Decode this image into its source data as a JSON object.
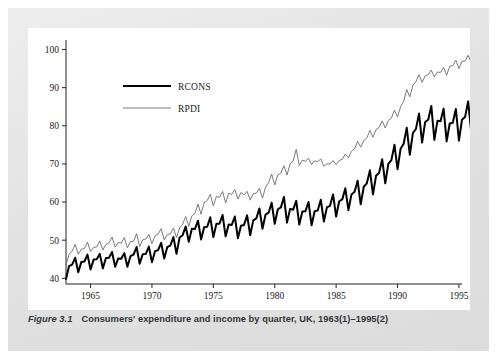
{
  "figure": {
    "caption_number": "Figure 3.1",
    "caption_text": "Consumers' expenditure and income by quarter, UK, 1963(1)–1995(2)",
    "panel_bg": "#ffffff",
    "frame_bg": "#e4e4e4"
  },
  "chart_data": {
    "type": "line",
    "title": "Consumers' expenditure and income by quarter, UK, 1963(1)–1995(2)",
    "xlabel": "",
    "ylabel": "",
    "xlim": [
      1963.0,
      1995.25
    ],
    "ylim": [
      38.5,
      102.5
    ],
    "grid": false,
    "legend_position": "upper-left-inside",
    "xticks": [
      1965,
      1970,
      1975,
      1980,
      1985,
      1990,
      1995
    ],
    "xtick_labels": [
      "1965",
      "1970",
      "1975",
      "1980",
      "1985",
      "1990",
      "1995"
    ],
    "yticks": [
      40,
      50,
      60,
      70,
      80,
      90,
      100
    ],
    "ytick_labels": [
      "40",
      "50",
      "60",
      "70",
      "80",
      "90",
      "100"
    ],
    "x_start": 1963.0,
    "x_step": 0.25,
    "series": [
      {
        "name": "RCONS",
        "color": "#000000",
        "width": 2.0,
        "values": [
          39.8,
          43.2,
          43.6,
          45.4,
          41.6,
          44.3,
          44.4,
          46.2,
          42.3,
          44.9,
          45.0,
          46.4,
          42.6,
          45.3,
          45.4,
          46.9,
          43.0,
          45.2,
          45.1,
          46.6,
          43.0,
          45.8,
          46.2,
          48.2,
          43.8,
          46.3,
          46.4,
          48.3,
          44.2,
          47.1,
          47.4,
          49.3,
          45.2,
          48.2,
          48.6,
          50.8,
          46.4,
          50.7,
          51.3,
          53.6,
          49.6,
          53.0,
          52.9,
          55.1,
          50.2,
          53.4,
          53.5,
          56.0,
          50.8,
          54.3,
          54.3,
          56.6,
          51.0,
          54.1,
          54.0,
          56.2,
          50.5,
          53.8,
          54.0,
          56.5,
          51.3,
          55.2,
          55.7,
          58.3,
          53.0,
          56.7,
          57.2,
          59.8,
          54.3,
          58.1,
          58.6,
          61.3,
          54.6,
          58.2,
          58.0,
          60.3,
          54.1,
          57.5,
          57.6,
          60.0,
          53.9,
          57.6,
          57.8,
          60.6,
          54.9,
          58.6,
          59.0,
          62.0,
          56.2,
          60.2,
          60.7,
          63.6,
          57.9,
          62.0,
          62.7,
          65.6,
          59.4,
          64.0,
          64.9,
          68.3,
          62.0,
          66.9,
          67.7,
          71.2,
          64.9,
          70.0,
          71.0,
          75.0,
          68.6,
          74.0,
          75.3,
          79.5,
          72.4,
          78.1,
          79.2,
          83.2,
          75.6,
          81.0,
          81.6,
          85.2,
          76.3,
          81.3,
          81.2,
          84.5,
          75.9,
          80.6,
          80.8,
          84.4,
          76.1,
          81.6,
          82.3,
          86.4,
          78.4,
          84.2,
          85.3,
          89.8,
          81.5,
          87.4,
          88.1,
          91.9,
          83.2,
          88.0
        ]
      },
      {
        "name": "RPDI",
        "color": "#6b6b6b",
        "width": 0.9,
        "values": [
          43.5,
          46.3,
          47.1,
          48.9,
          46.3,
          47.6,
          47.8,
          49.5,
          47.0,
          48.1,
          48.2,
          49.8,
          47.4,
          48.9,
          49.3,
          50.8,
          48.2,
          49.4,
          49.2,
          50.7,
          48.0,
          49.6,
          49.7,
          51.7,
          48.3,
          50.1,
          50.3,
          51.5,
          49.1,
          51.1,
          51.6,
          53.0,
          50.1,
          51.5,
          51.6,
          53.2,
          50.7,
          53.2,
          54.2,
          56.2,
          53.6,
          56.4,
          57.0,
          59.5,
          56.8,
          59.8,
          60.4,
          62.0,
          59.0,
          61.5,
          61.2,
          62.8,
          59.8,
          62.3,
          62.0,
          63.3,
          60.8,
          62.5,
          61.9,
          62.8,
          60.5,
          62.2,
          62.3,
          63.6,
          61.0,
          63.9,
          65.1,
          67.3,
          64.5,
          67.1,
          67.6,
          69.5,
          67.1,
          70.0,
          70.8,
          73.8,
          69.6,
          71.0,
          70.7,
          71.5,
          69.8,
          70.8,
          70.6,
          71.3,
          69.4,
          70.0,
          70.0,
          70.9,
          69.8,
          70.9,
          71.2,
          72.6,
          71.6,
          73.3,
          74.0,
          75.9,
          74.4,
          76.1,
          76.8,
          78.8,
          77.0,
          79.0,
          79.6,
          81.3,
          79.4,
          81.4,
          82.0,
          84.1,
          82.3,
          85.0,
          86.4,
          89.5,
          87.6,
          90.6,
          91.6,
          93.4,
          91.4,
          93.1,
          93.4,
          94.6,
          92.8,
          94.1,
          94.0,
          95.3,
          93.3,
          95.6,
          95.8,
          97.2,
          95.0,
          96.9,
          97.0,
          98.5,
          96.6,
          98.5,
          99.0,
          100.7,
          98.2,
          99.6,
          99.1,
          100.3,
          99.2,
          100.1
        ]
      }
    ]
  },
  "legend": {
    "entries": [
      {
        "label": "RCONS"
      },
      {
        "label": "RPDI"
      }
    ]
  }
}
